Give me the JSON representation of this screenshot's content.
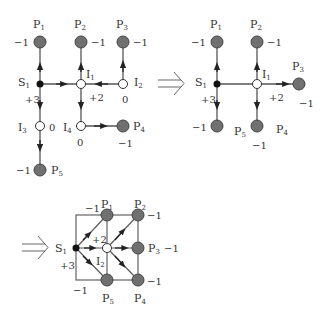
{
  "colors": {
    "line": "#555555",
    "node_fill": "#707070",
    "node_stroke": "#444444",
    "source": "#111111",
    "background": "#ffffff"
  },
  "diagrams": [
    {
      "id": "original",
      "nodes": [
        {
          "name": "S",
          "sub": "1",
          "type": "source",
          "value": "+3"
        },
        {
          "name": "P",
          "sub": "1",
          "type": "sink",
          "value": "−1"
        },
        {
          "name": "P",
          "sub": "2",
          "type": "sink",
          "value": "−1"
        },
        {
          "name": "P",
          "sub": "3",
          "type": "sink",
          "value": "−1"
        },
        {
          "name": "P",
          "sub": "4",
          "type": "sink",
          "value": "−1"
        },
        {
          "name": "P",
          "sub": "5",
          "type": "sink",
          "value": "−1"
        },
        {
          "name": "I",
          "sub": "1",
          "type": "intermediate",
          "value": "+2"
        },
        {
          "name": "I",
          "sub": "2",
          "type": "intermediate",
          "value": "0"
        },
        {
          "name": "I",
          "sub": "3",
          "type": "intermediate",
          "value": "0"
        },
        {
          "name": "I",
          "sub": "4",
          "type": "intermediate",
          "value": "0"
        }
      ]
    },
    {
      "id": "reduced",
      "nodes": [
        {
          "name": "S",
          "sub": "1",
          "value": "+3"
        },
        {
          "name": "I",
          "sub": "1",
          "value": "+2"
        },
        {
          "name": "P",
          "sub": "1",
          "value": "−1"
        },
        {
          "name": "P",
          "sub": "2",
          "value": "−1"
        },
        {
          "name": "P",
          "sub": "3",
          "value": "−1"
        },
        {
          "name": "P",
          "sub": "4",
          "value": "−1"
        },
        {
          "name": "P",
          "sub": "5",
          "value": "−1"
        }
      ]
    },
    {
      "id": "grid",
      "nodes": [
        {
          "name": "S",
          "sub": "1",
          "value": "+3"
        },
        {
          "name": "I",
          "sub": "2",
          "value": "+2"
        },
        {
          "name": "P",
          "sub": "1",
          "value": "−1"
        },
        {
          "name": "P",
          "sub": "2",
          "value": "−1"
        },
        {
          "name": "P",
          "sub": "3",
          "value": "−1"
        },
        {
          "name": "P",
          "sub": "4",
          "value": "−1"
        },
        {
          "name": "P",
          "sub": "5",
          "value": "−1"
        }
      ]
    }
  ],
  "labels": {
    "S": "S",
    "P": "P",
    "I": "I",
    "s1": "1",
    "p1": "1",
    "p2": "2",
    "p3": "3",
    "p4": "4",
    "p5": "5",
    "i1": "1",
    "i2": "2",
    "i3": "3",
    "i4": "4",
    "plus3": "+3",
    "plus2": "+2",
    "minus1": "−1",
    "zero": "0"
  }
}
